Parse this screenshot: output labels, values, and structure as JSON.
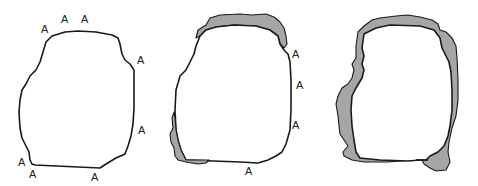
{
  "figure": {
    "panels": [
      {
        "id": "panel-1",
        "description": "outline with labels only",
        "labels": [
          {
            "text": "A",
            "x": 41,
            "y": 33
          },
          {
            "text": "A",
            "x": 61,
            "y": 23
          },
          {
            "text": "A",
            "x": 81,
            "y": 23
          },
          {
            "text": "A",
            "x": 137,
            "y": 64
          },
          {
            "text": "A",
            "x": 138,
            "y": 134
          },
          {
            "text": "A",
            "x": 18,
            "y": 166
          },
          {
            "text": "A",
            "x": 29,
            "y": 178
          },
          {
            "text": "A",
            "x": 91,
            "y": 181
          }
        ]
      },
      {
        "id": "panel-2",
        "description": "outline with shaded areas at top and lower left",
        "labels": [
          {
            "text": "A",
            "x": 292,
            "y": 58
          },
          {
            "text": "A",
            "x": 296,
            "y": 89
          },
          {
            "text": "A",
            "x": 292,
            "y": 129
          },
          {
            "text": "A",
            "x": 245,
            "y": 175
          }
        ]
      },
      {
        "id": "panel-3",
        "description": "outline with shaded areas around most of the perimeter",
        "labels": []
      }
    ],
    "colors": {
      "outline": "#1a1a1a",
      "shade": "#a6a6a6",
      "background": "#ffffff"
    }
  }
}
